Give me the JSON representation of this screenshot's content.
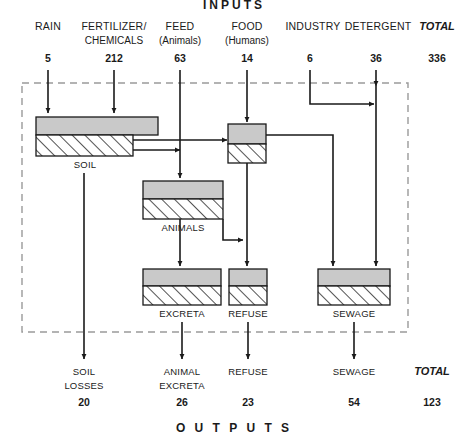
{
  "diagram": {
    "title_top": "INPUTS",
    "title_bottom": "O U T P U T S",
    "accent_fill": "#c9c9c9",
    "line_color": "#1a1a1a",
    "border_color": "#9a9a9a"
  },
  "inputs": {
    "total_label": "TOTAL",
    "total_value": "336",
    "items": [
      {
        "label": "RAIN",
        "sub": "",
        "value": "5"
      },
      {
        "label": "FERTILIZER/",
        "sub": "CHEMICALS",
        "value": "212"
      },
      {
        "label": "FEED",
        "sub": "(Animals)",
        "value": "63"
      },
      {
        "label": "FOOD",
        "sub": "(Humans)",
        "value": "14"
      },
      {
        "label": "INDUSTRY",
        "sub": "",
        "value": "6"
      },
      {
        "label": "DETERGENT",
        "sub": "",
        "value": "36"
      }
    ]
  },
  "stocks": [
    {
      "name": "soil",
      "label": "SOIL"
    },
    {
      "name": "humans",
      "label": ""
    },
    {
      "name": "animals",
      "label": "ANIMALS"
    },
    {
      "name": "excreta",
      "label": "EXCRETA"
    },
    {
      "name": "refuse",
      "label": "REFUSE"
    },
    {
      "name": "sewage",
      "label": "SEWAGE"
    }
  ],
  "outputs": {
    "total_label": "TOTAL",
    "total_value": "123",
    "items": [
      {
        "label": "SOIL",
        "sub": "LOSSES",
        "value": "20"
      },
      {
        "label": "ANIMAL",
        "sub": "EXCRETA",
        "value": "26"
      },
      {
        "label": "REFUSE",
        "sub": "",
        "value": "23"
      },
      {
        "label": "SEWAGE",
        "sub": "",
        "value": "54"
      }
    ]
  }
}
